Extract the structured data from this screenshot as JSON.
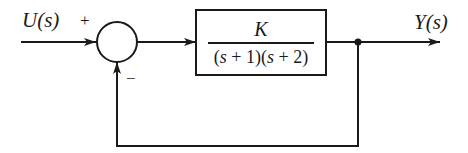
{
  "diagram": {
    "type": "feedback-control-block-diagram",
    "input": {
      "label": "U(s)"
    },
    "output": {
      "label": "Y(s)"
    },
    "summing_junction": {
      "signs": {
        "top": "+",
        "bottom": "−"
      }
    },
    "plant_block": {
      "numerator": "K",
      "denominator_text": "(s + 1)(s + 2)",
      "denominator_parts": [
        "(",
        "s",
        " + 1)(",
        "s",
        " + 2)"
      ]
    },
    "feedback": {
      "type": "unity",
      "sign": "negative"
    },
    "colors": {
      "line": "#1a1a1a",
      "background": "#ffffff"
    }
  }
}
